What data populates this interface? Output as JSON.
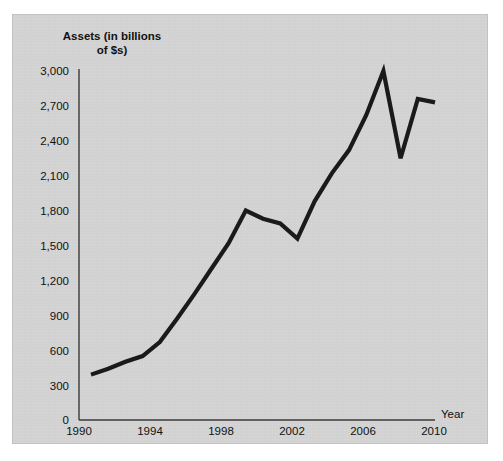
{
  "figure": {
    "caption_remnant": "",
    "panel_background": "#d2d2d2",
    "line_color": "#1a1a1a",
    "axis_color": "#3a3a3a",
    "text_color": "#111111"
  },
  "chart_data": {
    "type": "line",
    "title": "Assets (in billions\nof $s)",
    "xlabel": "Year",
    "ylabel": "Assets (in billions of $s)",
    "xlim": [
      1990,
      2010
    ],
    "ylim": [
      0,
      3000
    ],
    "grid": false,
    "legend": null,
    "x_tick_labels": [
      "1990",
      "1994",
      "1998",
      "2002",
      "2006",
      "2010"
    ],
    "x_ticks": [
      1990,
      1994,
      1998,
      2002,
      2006,
      2010
    ],
    "y_tick_labels": [
      "0",
      "300",
      "600",
      "900",
      "1,200",
      "1,500",
      "1,800",
      "2,100",
      "2,400",
      "2,700",
      "3,000"
    ],
    "y_ticks": [
      0,
      300,
      600,
      900,
      1200,
      1500,
      1800,
      2100,
      2400,
      2700,
      3000
    ],
    "x": [
      1990,
      1991,
      1992,
      1993,
      1994,
      1995,
      1996,
      1997,
      1998,
      1999,
      2000,
      2001,
      2002,
      2003,
      2004,
      2005,
      2006,
      2007,
      2008,
      2009,
      2010
    ],
    "values": [
      390,
      440,
      500,
      550,
      670,
      870,
      1080,
      1300,
      1520,
      1800,
      1730,
      1690,
      1560,
      1880,
      2120,
      2320,
      2620,
      3000,
      2250,
      2760,
      2730
    ],
    "series": [
      {
        "name": "Assets",
        "values": [
          390,
          440,
          500,
          550,
          670,
          870,
          1080,
          1300,
          1520,
          1800,
          1730,
          1690,
          1560,
          1880,
          2120,
          2320,
          2620,
          3000,
          2250,
          2760,
          2730
        ]
      }
    ]
  }
}
